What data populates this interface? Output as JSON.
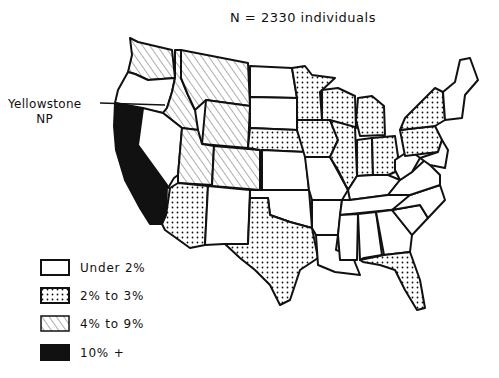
{
  "title": "N = 2330 individuals",
  "annotation": {
    "line1": "Yellowstone",
    "line2": "NP"
  },
  "legend": [
    {
      "label": "Under 2%",
      "pattern": "white"
    },
    {
      "label": "2% to 3%",
      "pattern": "dots"
    },
    {
      "label": "4% to 9%",
      "pattern": "hatch"
    },
    {
      "label": "10% +",
      "pattern": "black"
    }
  ],
  "categories": {
    "black_10_plus": [
      "California"
    ],
    "hatch_4_to_9": [
      "Washington",
      "Idaho",
      "Montana",
      "Wyoming",
      "Utah",
      "Colorado"
    ],
    "dots_2_to_3": [
      "Minnesota",
      "Wisconsin",
      "Michigan",
      "Iowa",
      "Nebraska",
      "Illinois",
      "Indiana",
      "Ohio",
      "New York",
      "Pennsylvania",
      "Arizona",
      "Texas",
      "Florida"
    ],
    "white_under_2": [
      "Oregon",
      "Nevada",
      "New Mexico",
      "North Dakota",
      "South Dakota",
      "Kansas",
      "Oklahoma",
      "Missouri",
      "Arkansas",
      "Louisiana",
      "Mississippi",
      "Alabama",
      "Georgia",
      "Tennessee",
      "Kentucky",
      "West Virginia",
      "Virginia",
      "North Carolina",
      "South Carolina",
      "Maine",
      "New Hampshire",
      "Vermont",
      "Massachusetts",
      "Connecticut",
      "Rhode Island",
      "New Jersey",
      "Delaware",
      "Maryland"
    ]
  },
  "colors": {
    "ink": "#111111",
    "background": "#ffffff"
  }
}
